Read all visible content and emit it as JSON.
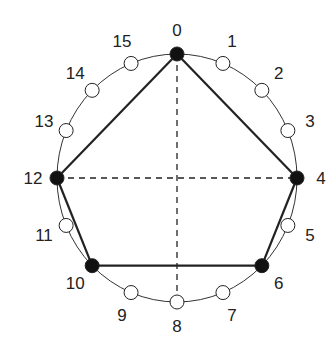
{
  "diagram": {
    "type": "circular-node-diagram",
    "center": [
      177,
      178
    ],
    "radius_x": 120,
    "radius_y": 124,
    "node_count": 16,
    "nodes": [
      {
        "id": 0,
        "label": "0",
        "filled": true
      },
      {
        "id": 1,
        "label": "1",
        "filled": false
      },
      {
        "id": 2,
        "label": "2",
        "filled": false
      },
      {
        "id": 3,
        "label": "3",
        "filled": false
      },
      {
        "id": 4,
        "label": "4",
        "filled": true
      },
      {
        "id": 5,
        "label": "5",
        "filled": false
      },
      {
        "id": 6,
        "label": "6",
        "filled": true
      },
      {
        "id": 7,
        "label": "7",
        "filled": false
      },
      {
        "id": 8,
        "label": "8",
        "filled": false
      },
      {
        "id": 9,
        "label": "9",
        "filled": false
      },
      {
        "id": 10,
        "label": "10",
        "filled": true
      },
      {
        "id": 11,
        "label": "11",
        "filled": false
      },
      {
        "id": 12,
        "label": "12",
        "filled": true
      },
      {
        "id": 13,
        "label": "13",
        "filled": false
      },
      {
        "id": 14,
        "label": "14",
        "filled": false
      },
      {
        "id": 15,
        "label": "15",
        "filled": false
      }
    ],
    "pentagon_edges": [
      [
        0,
        4
      ],
      [
        4,
        6
      ],
      [
        6,
        10
      ],
      [
        10,
        12
      ],
      [
        12,
        0
      ]
    ],
    "dashed_axes": [
      [
        0,
        8
      ],
      [
        12,
        4
      ]
    ],
    "colors": {
      "stroke": "#222222",
      "filled_node": "#111111",
      "empty_node": "#ffffff",
      "background": "#ffffff"
    }
  }
}
